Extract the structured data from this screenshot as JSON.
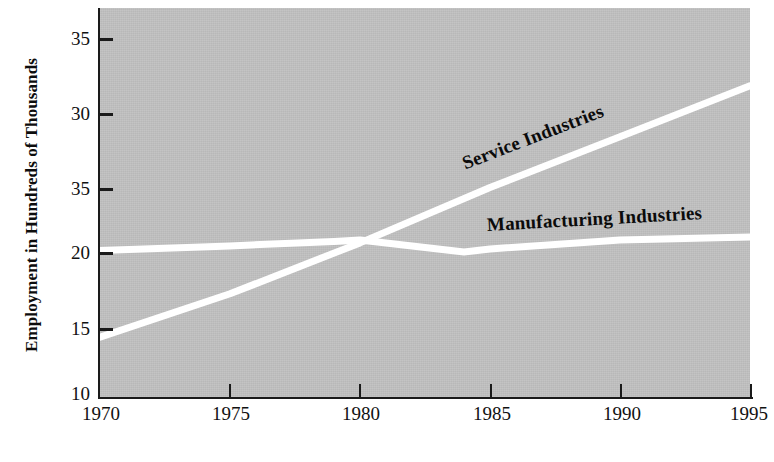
{
  "chart_data": {
    "type": "line",
    "title": "",
    "xlabel": "",
    "ylabel": "Employment in Hundreds of Thousands",
    "x": [
      1970,
      1975,
      1980,
      1985,
      1990,
      1995
    ],
    "xlim": [
      1970,
      1995
    ],
    "ylim": [
      10,
      36
    ],
    "xticklabels": [
      "1970",
      "1975",
      "1980",
      "1985",
      "1990",
      "1995"
    ],
    "yticklabels": [
      "10",
      "15",
      "20",
      "35",
      "30",
      "35"
    ],
    "ytickvalues": [
      10,
      15,
      20,
      25,
      30,
      35
    ],
    "grid": false,
    "legend_position": "inline-along-lines",
    "background_color": "#c0c0c0",
    "line_color": "#ffffff",
    "axis_color": "#1a1a1a",
    "note": "Third y tick label reads 35 in the original print (apparent typo for 25)",
    "series": [
      {
        "name": "Service Industries",
        "x": [
          1970,
          1975,
          1980,
          1985,
          1990,
          1995
        ],
        "values": [
          14.0,
          16.9,
          20.3,
          24.0,
          27.4,
          30.8
        ]
      },
      {
        "name": "Manufacturing Industries",
        "x": [
          1970,
          1975,
          1979,
          1980,
          1984,
          1985,
          1990,
          1995
        ],
        "values": [
          19.8,
          20.1,
          20.4,
          20.5,
          19.7,
          19.9,
          20.5,
          20.7
        ]
      }
    ],
    "annotations": [
      {
        "text": "Service Industries",
        "rotation_deg": -21
      },
      {
        "text": "Manufacturing Industries",
        "rotation_deg": -3
      }
    ]
  },
  "axes": {
    "y_title": "Employment in Hundreds of Thousands",
    "y_ticks": [
      {
        "label": "35",
        "y": 38
      },
      {
        "label": "30",
        "y": 113
      },
      {
        "label": "35",
        "y": 188
      },
      {
        "label": "20",
        "y": 252
      },
      {
        "label": "15",
        "y": 328
      },
      {
        "label": "10",
        "y": 393
      }
    ],
    "x_ticks": [
      {
        "label": "1970",
        "x": 100
      },
      {
        "label": "1975",
        "x": 230
      },
      {
        "label": "1980",
        "x": 360
      },
      {
        "label": "1985",
        "x": 491
      },
      {
        "label": "1990",
        "x": 621
      },
      {
        "label": "1995",
        "x": 751
      }
    ]
  },
  "series_labels": {
    "service": "Service Industries",
    "manufacturing": "Manufacturing Industries"
  }
}
